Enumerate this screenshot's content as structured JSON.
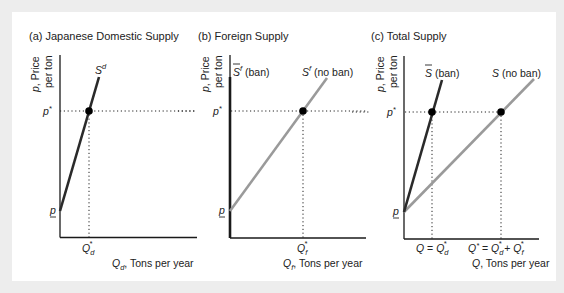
{
  "figure": {
    "panels": [
      {
        "id": "a",
        "title": "(a) Japanese Domestic Supply",
        "y_label_line1": "p, Price",
        "y_label_line2": "per ton",
        "y_ticks": {
          "p_star": "p*",
          "p_min": "p"
        },
        "x_tick": "Q",
        "x_tick_sub": "d",
        "x_tick_sup": "*",
        "x_label": "Q",
        "x_label_sub": "d",
        "x_label_rest": ", Tons per year",
        "curves": [
          {
            "name": "S",
            "sup": "d",
            "color": "#2a2a2a"
          }
        ]
      },
      {
        "id": "b",
        "title": "(b) Foreign Supply",
        "y_label_line1": "p, Price",
        "y_label_line2": "per ton",
        "y_ticks": {
          "p_star": "p*",
          "p_min": "p"
        },
        "x_tick": "Q",
        "x_tick_sub": "f",
        "x_tick_sup": "*",
        "x_label": "Q",
        "x_label_sub": "f",
        "x_label_rest": ", Tons per year",
        "curves": [
          {
            "name": "S̄",
            "sup": "f",
            "suffix": " (ban)",
            "color": "#1a1a1a"
          },
          {
            "name": "S",
            "sup": "f",
            "suffix": " (no ban)",
            "color": "#9a9a9a"
          }
        ]
      },
      {
        "id": "c",
        "title": "(c) Total Supply",
        "y_label_line1": "p, Price",
        "y_label_line2": "per ton",
        "y_ticks": {
          "p_star": "p*",
          "p_min": "p"
        },
        "x_tick_1": "Q = Q",
        "x_tick_1_sub": "d",
        "x_tick_2_a": "Q* = Q",
        "x_tick_2_sub1": "d",
        "x_tick_2_mid": " + Q",
        "x_tick_2_sub2": "f",
        "star": "*",
        "x_label": "Q",
        "x_label_rest": ", Tons per year",
        "curves": [
          {
            "name": "S̄",
            "suffix": " (ban)",
            "color": "#2a2a2a"
          },
          {
            "name": "S",
            "suffix": " (no ban)",
            "color": "#9a9a9a"
          }
        ]
      }
    ],
    "colors": {
      "dark_curve": "#2a2a2a",
      "gray_curve": "#9a9a9a",
      "axis": "#1a1a1a",
      "background": "#ededed",
      "panel": "#ffffff"
    }
  }
}
